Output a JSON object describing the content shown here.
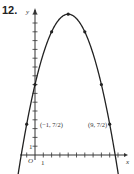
{
  "problem": {
    "number": "12."
  },
  "chart_data": {
    "type": "line",
    "title": "",
    "xlabel": "x",
    "ylabel": "y",
    "function": "y = 16 - (1/2)(x - 4)^2",
    "points": [
      {
        "x": -1,
        "y": 3.5,
        "label": "(−1, 7/2)"
      },
      {
        "x": 0,
        "y": 8
      },
      {
        "x": 2,
        "y": 14
      },
      {
        "x": 4,
        "y": 16
      },
      {
        "x": 6,
        "y": 14
      },
      {
        "x": 8,
        "y": 8
      },
      {
        "x": 9,
        "y": 3.5,
        "label": "(9, 7/2)"
      }
    ],
    "x_intercepts": [
      -1.66,
      9.66
    ],
    "xlim": [
      -2,
      11
    ],
    "ylim": [
      -1,
      17
    ],
    "x_tick_label": "1",
    "y_tick_label": "1",
    "origin_label": "O",
    "grid": false,
    "legend": null
  },
  "labels": {
    "origin": "O",
    "x_axis": "x",
    "y_axis": "y",
    "x_unit": "1",
    "y_unit": "1",
    "left_point": "(−1, 7/2)",
    "right_point": "(9, 7/2)"
  }
}
